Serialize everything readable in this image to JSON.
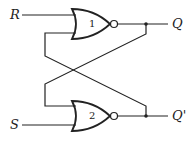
{
  "diagram": {
    "type": "SR latch (cross-coupled NOR gates)",
    "inputs": [
      {
        "label": "R"
      },
      {
        "label": "S"
      }
    ],
    "outputs": [
      {
        "label": "Q"
      },
      {
        "label": "Q'"
      }
    ],
    "gates": [
      {
        "number": "1",
        "kind": "NOR"
      },
      {
        "number": "2",
        "kind": "NOR"
      }
    ],
    "colors": {
      "line": "#222222",
      "background": "#ffffff"
    }
  }
}
